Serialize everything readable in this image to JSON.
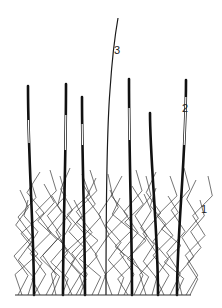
{
  "figure": {
    "labels": [
      {
        "id": "label-1",
        "text": "1",
        "refers_to": "thin zigzag stems"
      },
      {
        "id": "label-2",
        "text": "2",
        "refers_to": "segmented shoot (light section)"
      },
      {
        "id": "label-3",
        "text": "3",
        "refers_to": "tall slender stalk"
      }
    ],
    "colors": {
      "line": "#1a1a1a",
      "background": "#ffffff"
    }
  }
}
